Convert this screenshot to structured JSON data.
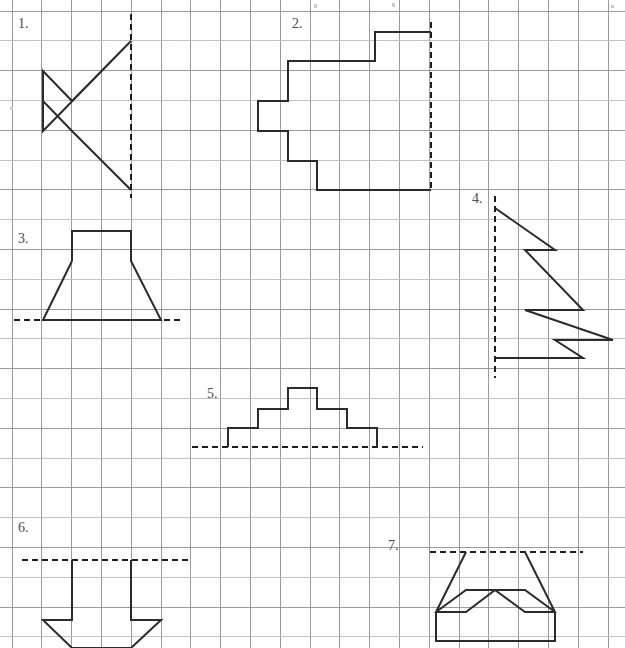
{
  "page": {
    "width": 625,
    "height": 648,
    "background_color": "#ffffff"
  },
  "grid": {
    "origin_x": 12,
    "origin_y": 11,
    "cell": 29.8,
    "columns": 20,
    "rows": 21,
    "line_color": "#8d8f91",
    "faint_line_color": "#b9bcbe",
    "line_width": 0.9
  },
  "style": {
    "shape_color": "#2b2b2b",
    "shape_width": 2.0,
    "mirror_color": "#1d1d1d",
    "mirror_dash": "6 4",
    "label_color": "#4a4a4a",
    "label_size": 14
  },
  "figures": [
    {
      "id": "figure-1",
      "label": "1.",
      "label_x": 18,
      "label_y": 28,
      "mirror": {
        "orientation": "vertical",
        "x1": 131,
        "y1": 14,
        "x2": 131,
        "y2": 198
      },
      "shape": "M 131,41 L 43,131 L 43,71 L 72,101 L 131,41",
      "shape_extra": "M 43,131 L 43,101 L 72,131 L 131,190",
      "points": "vertical mirror at x=131; polyline (131,41)-(72,101)-(43,71)-(43,131)-(72,101); polyline (43,131)-(72,131)-(131,190) approx"
    },
    {
      "id": "figure-2",
      "label": "2.",
      "label_x": 292,
      "label_y": 28,
      "mirror": {
        "orientation": "vertical",
        "x1": 431,
        "y1": 22,
        "x2": 431,
        "y2": 192
      },
      "shape": "M 431,32 L 375,32 L 375,61 L 288,61 L 288,101 L 258,101 L 258,131 L 288,131 L 288,161 L 317,161 L 317,190 L 431,190",
      "points": "staircase polygon open at mirror x=431"
    },
    {
      "id": "figure-3",
      "label": "3.",
      "label_x": 18,
      "label_y": 243,
      "mirror": {
        "orientation": "horizontal",
        "x1": 14,
        "y1": 320,
        "x2": 181,
        "y2": 320
      },
      "shape": "M 72,261 L 72,231 L 131,231 L 131,261 L 161,320 L 43,320 L 72,261",
      "points": "trapezoid with rectangular neck sitting on horizontal mirror y=320"
    },
    {
      "id": "figure-4",
      "label": "4.",
      "label_x": 472,
      "label_y": 203,
      "mirror": {
        "orientation": "vertical",
        "x1": 495,
        "y1": 196,
        "x2": 495,
        "y2": 378
      },
      "shape": "M 495,208 L 555,250 L 525,250 L 583,310 L 525,310 L 613,340 L 555,340 L 583,358 L 495,358",
      "points": "sawtooth / arrow barbs meeting vertical mirror x=495"
    },
    {
      "id": "figure-5",
      "label": "5.",
      "label_x": 207,
      "label_y": 398,
      "mirror": {
        "orientation": "horizontal",
        "x1": 192,
        "y1": 447,
        "x2": 423,
        "y2": 447
      },
      "shape": "M 228,447 L 228,428 L 258,428 L 258,409 L 288,409 L 288,388 L 317,388 L 317,409 L 347,409 L 347,428 L 377,428 L 377,447",
      "points": "stepped pyramid standing on horizontal mirror y=447"
    },
    {
      "id": "figure-6",
      "label": "6.",
      "label_x": 18,
      "label_y": 532,
      "mirror": {
        "orientation": "horizontal",
        "x1": 22,
        "y1": 560,
        "x2": 190,
        "y2": 560
      },
      "shape": "M 72,560 L 72,620 L 43,620 L 72,648 L 131,648 L 161,620 L 131,620 L 131,560",
      "points": "downward bucket shape hanging from horizontal mirror y=560, clipped by page bottom"
    },
    {
      "id": "figure-7",
      "label": "7.",
      "label_x": 388,
      "label_y": 550,
      "mirror": {
        "orientation": "horizontal",
        "x1": 430,
        "y1": 552,
        "x2": 583,
        "y2": 552
      },
      "shape": "M 466,552 L 436,620 L 555,620 L 525,552 L 555,612 L 525,590 L 555,590 L 466,552 L 495,590 L 466,590 L 436,612",
      "shape_parts": [
        "M 466,552 L 436,612 L 466,612 L 495,590 L 466,590 L 436,612",
        "M 525,552 L 555,612 L 525,612 L 495,590 L 525,590 L 555,612",
        "M 436,612 L 436,641 L 555,641 L 555,612"
      ],
      "points": "two mirrored chevrons over a rectangle, hanging from horizontal mirror y=552"
    }
  ],
  "specks": [
    {
      "x": 314,
      "y": 4,
      "w": 3,
      "h": 4
    },
    {
      "x": 392,
      "y": 3,
      "w": 3,
      "h": 4
    },
    {
      "x": 611,
      "y": 5,
      "w": 3,
      "h": 3
    },
    {
      "x": 10,
      "y": 107,
      "w": 3,
      "h": 3
    }
  ]
}
